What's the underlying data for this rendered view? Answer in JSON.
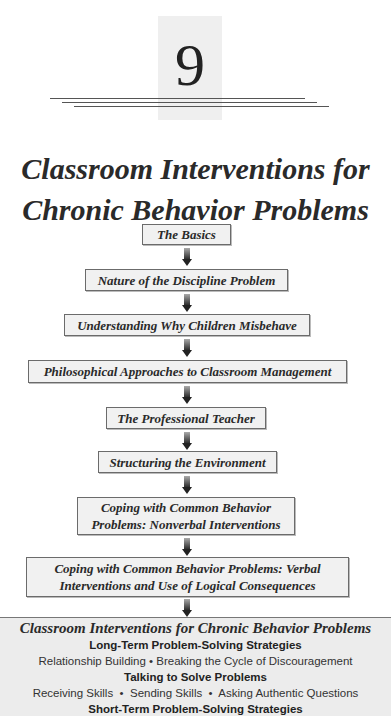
{
  "chapter": {
    "number": "9"
  },
  "title": {
    "line1": "Classroom Interventions for",
    "line2": "Chronic Behavior Problems"
  },
  "flowchart": {
    "boxes": [
      {
        "label": "The Basics"
      },
      {
        "label": "Nature of the Discipline Problem"
      },
      {
        "label": "Understanding Why Children Misbehave"
      },
      {
        "label": "Philosophical Approaches to Classroom Management"
      },
      {
        "label": "The Professional Teacher"
      },
      {
        "label": "Structuring the Environment"
      },
      {
        "line1": "Coping with Common Behavior",
        "line2": "Problems: Nonverbal Interventions"
      },
      {
        "line1": "Coping with Common Behavior Problems: Verbal",
        "line2": "Interventions and Use of Logical Consequences"
      }
    ]
  },
  "current_chapter_panel": {
    "title": "Classroom Interventions for Chronic Behavior Problems",
    "sections": [
      {
        "heading": "Long-Term Problem-Solving Strategies",
        "items": "Relationship Building • Breaking the Cycle of Discouragement"
      },
      {
        "heading": "Talking to Solve Problems",
        "items": "Receiving Skills  •  Sending Skills  •  Asking Authentic Questions"
      },
      {
        "heading": "Short-Term Problem-Solving Strategies",
        "items": "Self-Monitoring • Anecdotal Record Keeping • Behavior Contracting"
      }
    ]
  }
}
